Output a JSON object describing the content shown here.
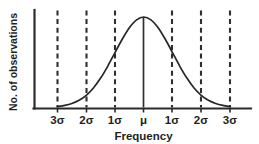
{
  "chart_data": {
    "type": "line",
    "title": "",
    "xlabel": "Frequency",
    "ylabel": "No. of observations",
    "grid": false,
    "legend": null,
    "x_tick_positions": [
      -3,
      -2,
      -1,
      0,
      1,
      2,
      3
    ],
    "x_tick_labels": [
      "3σ",
      "2σ",
      "1σ",
      "μ",
      "1σ",
      "2σ",
      "3σ"
    ],
    "xlim": [
      -3.55,
      3.85
    ],
    "ylim": [
      0,
      1.12
    ],
    "y_axis_ticks_shown": false,
    "curve": {
      "name": "normal-distribution",
      "description": "Gaussian bell curve, mean at μ, standard deviation σ",
      "mean": 0,
      "sigma": 1,
      "peak_value": 1.0,
      "x": [
        -3,
        -2.75,
        -2.5,
        -2.25,
        -2,
        -1.75,
        -1.5,
        -1.25,
        -1,
        -0.75,
        -0.5,
        -0.25,
        0,
        0.25,
        0.5,
        0.75,
        1,
        1.25,
        1.5,
        1.75,
        2,
        2.25,
        2.5,
        2.75,
        3
      ],
      "y": [
        0.011,
        0.023,
        0.044,
        0.079,
        0.135,
        0.216,
        0.325,
        0.458,
        0.607,
        0.754,
        0.882,
        0.969,
        1.0,
        0.969,
        0.882,
        0.754,
        0.607,
        0.458,
        0.325,
        0.216,
        0.135,
        0.079,
        0.044,
        0.023,
        0.011
      ]
    },
    "vertical_markers": [
      {
        "label": "3σ",
        "x": -3,
        "style": "dashed",
        "full_height": true
      },
      {
        "label": "2σ",
        "x": -2,
        "style": "dashed",
        "full_height": true
      },
      {
        "label": "1σ",
        "x": -1,
        "style": "dashed",
        "full_height": true
      },
      {
        "label": "μ",
        "x": 0,
        "style": "solid",
        "full_height": false
      },
      {
        "label": "1σ",
        "x": 1,
        "style": "dashed",
        "full_height": true
      },
      {
        "label": "2σ",
        "x": 2,
        "style": "dashed",
        "full_height": true
      },
      {
        "label": "3σ",
        "x": 3,
        "style": "dashed",
        "full_height": true
      }
    ],
    "colors": {
      "curve": "#262626",
      "axis": "#2b2b2b",
      "marker": "#2f2f2f",
      "text": "#1f1f1f",
      "background": "#ffffff"
    }
  },
  "labels": {
    "tick_0": "3σ",
    "tick_1": "2σ",
    "tick_2": "1σ",
    "tick_3": "μ",
    "tick_4": "1σ",
    "tick_5": "2σ",
    "tick_6": "3σ",
    "x_title": "Frequency",
    "y_title": "No. of observations"
  }
}
